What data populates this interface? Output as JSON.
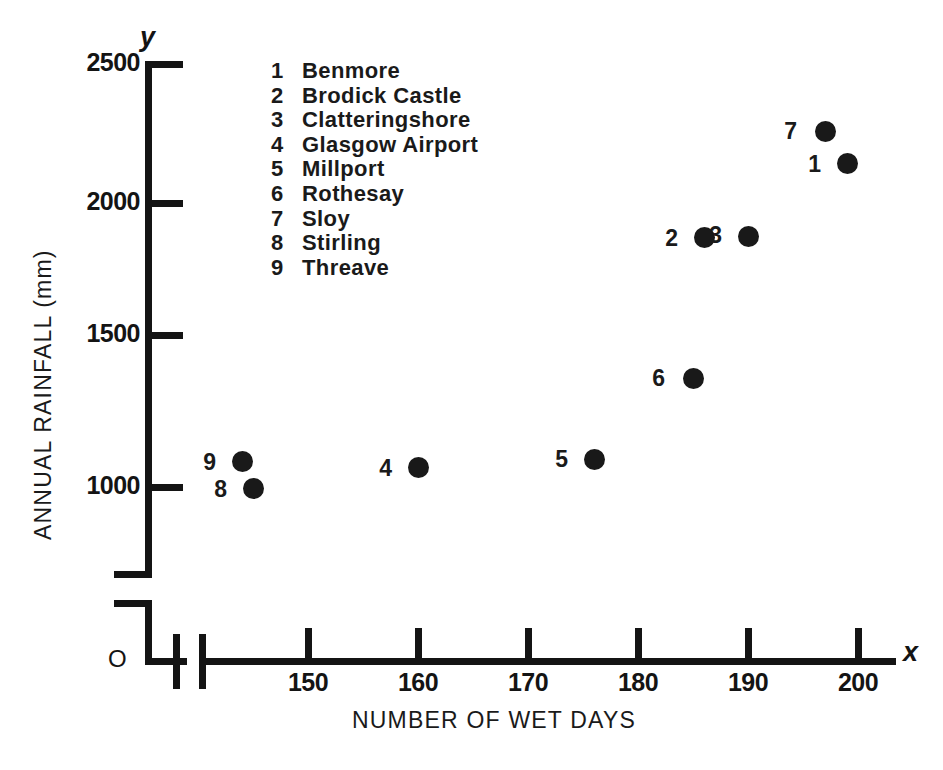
{
  "chart_data": {
    "type": "scatter",
    "title": "",
    "xlabel": "NUMBER OF WET DAYS",
    "ylabel": "ANNUAL RAINFALL (mm)",
    "x_axis_symbol": "x",
    "y_axis_symbol": "y",
    "origin_label": "O",
    "xlim": [
      143,
      203
    ],
    "ylim": [
      950,
      2500
    ],
    "x_ticks": [
      150,
      160,
      170,
      180,
      190,
      200
    ],
    "x_tick_labels": [
      "150",
      "160",
      "170",
      "180",
      "190",
      "200"
    ],
    "y_ticks": [
      1000,
      1500,
      2000,
      2500
    ],
    "y_tick_labels": [
      "1000",
      "1500",
      "2000",
      "2500"
    ],
    "grid": false,
    "axis_break_x": true,
    "axis_break_y": true,
    "legend_position": "upper-left-inside",
    "points": [
      {
        "key": "1",
        "name": "Benmore",
        "x": 199,
        "y": 2140
      },
      {
        "key": "2",
        "name": "Brodick Castle",
        "x": 186,
        "y": 1880
      },
      {
        "key": "3",
        "name": "Clatteringshore",
        "x": 190,
        "y": 1885
      },
      {
        "key": "4",
        "name": "Glasgow Airport",
        "x": 160,
        "y": 1070
      },
      {
        "key": "5",
        "name": "Millport",
        "x": 176,
        "y": 1100
      },
      {
        "key": "6",
        "name": "Rothesay",
        "x": 185,
        "y": 1385
      },
      {
        "key": "7",
        "name": "Sloy",
        "x": 197,
        "y": 2255
      },
      {
        "key": "8",
        "name": "Stirling",
        "x": 145,
        "y": 995
      },
      {
        "key": "9",
        "name": "Threave",
        "x": 144,
        "y": 1090
      }
    ]
  },
  "legend": {
    "items": [
      {
        "key": "1",
        "name": "Benmore"
      },
      {
        "key": "2",
        "name": "Brodick Castle"
      },
      {
        "key": "3",
        "name": "Clatteringshore"
      },
      {
        "key": "4",
        "name": "Glasgow Airport"
      },
      {
        "key": "5",
        "name": "Millport"
      },
      {
        "key": "6",
        "name": "Rothesay"
      },
      {
        "key": "7",
        "name": "Sloy"
      },
      {
        "key": "8",
        "name": "Stirling"
      },
      {
        "key": "9",
        "name": "Threave"
      }
    ]
  },
  "colors": {
    "ink": "#141414",
    "marker": "#191919",
    "background": "#ffffff"
  }
}
